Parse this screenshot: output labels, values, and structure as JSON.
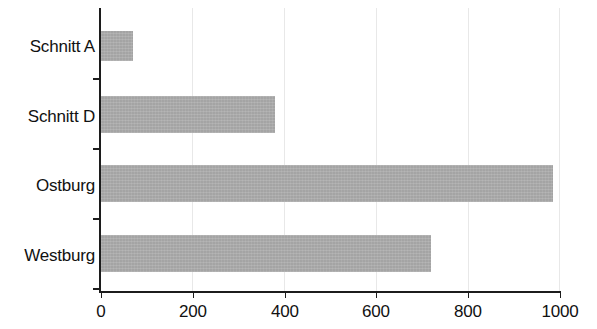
{
  "chart_data": {
    "type": "bar",
    "orientation": "horizontal",
    "title": "",
    "subtitle": "",
    "xlabel": "",
    "ylabel": "",
    "categories": [
      "Westburg",
      "Ostburg",
      "Schnitt D",
      "Schnitt A"
    ],
    "values": [
      720,
      985,
      380,
      70
    ],
    "series": [
      {
        "name": "",
        "values": [
          720,
          985,
          380,
          70
        ]
      }
    ],
    "xlim": [
      0,
      1000
    ],
    "xticks": [
      0,
      200,
      400,
      600,
      800,
      1000
    ],
    "xtick_labels": [
      "0",
      "200",
      "400",
      "600",
      "800",
      "1000"
    ],
    "grid": "vertical",
    "legend": "none",
    "bar_color": "#ababab",
    "axis_color": "#1c1c1c",
    "gridline_color": "#e8e8e8",
    "background": "#ffffff",
    "bars": [
      {
        "label": "Schnitt A",
        "value": 70,
        "top": 31,
        "height": 30
      },
      {
        "label": "Schnitt D",
        "value": 380,
        "top": 96,
        "height": 37
      },
      {
        "label": "Ostburg",
        "value": 985,
        "top": 165,
        "height": 37
      },
      {
        "label": "Westburg",
        "value": 720,
        "top": 235,
        "height": 37
      }
    ]
  }
}
